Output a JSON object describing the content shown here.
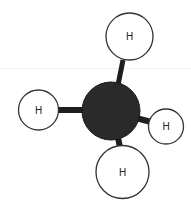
{
  "diagram": {
    "type": "molecule-ball-and-stick",
    "molecule": "methane",
    "central_atom": {
      "id": "C",
      "label": "",
      "fill": "#2a2a2a"
    },
    "atoms": [
      {
        "id": "H-top",
        "label": "H",
        "fill": "#ffffff"
      },
      {
        "id": "H-left",
        "label": "H",
        "fill": "#ffffff"
      },
      {
        "id": "H-right",
        "label": "H",
        "fill": "#ffffff"
      },
      {
        "id": "H-bottom",
        "label": "H",
        "fill": "#ffffff"
      }
    ],
    "bonds": [
      {
        "from": "C",
        "to": "H-top"
      },
      {
        "from": "C",
        "to": "H-left"
      },
      {
        "from": "C",
        "to": "H-right"
      },
      {
        "from": "C",
        "to": "H-bottom"
      }
    ],
    "colors": {
      "outline": "#333333",
      "bond": "#1e1e1e",
      "carbon": "#2a2a2a"
    }
  }
}
